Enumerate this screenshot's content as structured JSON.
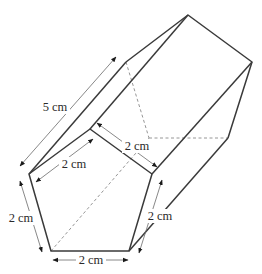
{
  "figure": {
    "type": "pentagonal prism",
    "labels": {
      "length": "5 cm",
      "front_top_left_edge": "2 cm",
      "front_top_right_edge": "2 cm",
      "front_left_edge": "2 cm",
      "front_right_edge": "2 cm",
      "front_bottom_edge": "2 cm"
    },
    "measurements": {
      "side_length_cm": 2,
      "prism_length_cm": 5,
      "unit": "cm"
    }
  }
}
